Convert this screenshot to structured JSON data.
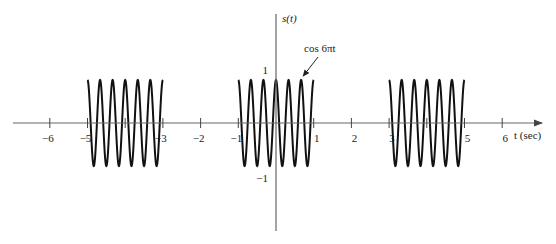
{
  "chart_data": {
    "type": "line",
    "title": "",
    "xlabel": "t (sec)",
    "ylabel": "s(t)",
    "xlim": [
      -6.8,
      7.0
    ],
    "ylim": [
      -2.5,
      2.5
    ],
    "grid": false,
    "x_ticks": [
      -6,
      -5,
      -3,
      -2,
      -1,
      1,
      2,
      3,
      5,
      6
    ],
    "x_tick_labels": [
      "−6",
      "−5",
      "−3",
      "−2",
      "−1",
      "1",
      "2",
      "3",
      "5",
      "6"
    ],
    "x_minor_ticks": [
      -4,
      0,
      4
    ],
    "y_ticks": [
      1,
      -1
    ],
    "y_tick_labels": [
      "1",
      "−1"
    ],
    "series": [
      {
        "name": "s(t)",
        "function": "cos(6*pi*t)",
        "frequency_hz": 3,
        "amplitude": 1,
        "bursts": [
          [
            -5,
            -3
          ],
          [
            -1,
            1
          ],
          [
            3,
            5
          ]
        ],
        "period_sec": 4,
        "burst_duration_sec": 2
      }
    ],
    "annotations": [
      {
        "text": "cos 6πt",
        "points_to_t": 0.67,
        "points_to_y": 1
      }
    ]
  }
}
